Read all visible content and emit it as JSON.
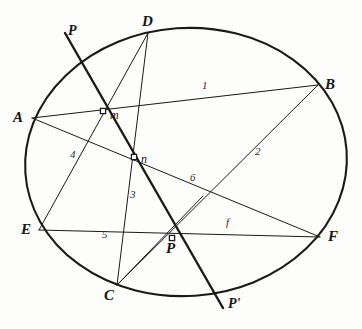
{
  "figure": {
    "canvas": {
      "width": 362,
      "height": 329
    },
    "background_color": "#fdfdfc",
    "ink_color": "#1a1a1a"
  },
  "conic": {
    "name": "ellipse",
    "center": {
      "x": 186,
      "y": 162
    },
    "radius_x": 161,
    "radius_y": 134,
    "rotation_deg": -4,
    "stroke_width": 2.1
  },
  "points": [
    {
      "id": "A",
      "label": "A",
      "x": 32,
      "y": 118,
      "label_x": 13,
      "label_y": 110,
      "marker": "none"
    },
    {
      "id": "B",
      "label": "B",
      "x": 318,
      "y": 85,
      "label_x": 325,
      "label_y": 77,
      "marker": "none"
    },
    {
      "id": "C",
      "label": "C",
      "x": 117,
      "y": 285,
      "label_x": 104,
      "label_y": 288,
      "marker": "none"
    },
    {
      "id": "D",
      "label": "D",
      "x": 148,
      "y": 33,
      "label_x": 142,
      "label_y": 14,
      "marker": "none"
    },
    {
      "id": "E",
      "label": "E",
      "x": 39,
      "y": 230,
      "label_x": 21,
      "label_y": 222,
      "marker": "none"
    },
    {
      "id": "F",
      "label": "F",
      "x": 320,
      "y": 237,
      "label_x": 328,
      "label_y": 229,
      "marker": "none"
    },
    {
      "id": "m",
      "label": "m",
      "x": 103,
      "y": 111,
      "label_x": 110,
      "label_y": 109,
      "marker": "square"
    },
    {
      "id": "n",
      "label": "n",
      "x": 134,
      "y": 157,
      "label_x": 141,
      "label_y": 153,
      "marker": "square"
    },
    {
      "id": "P",
      "label": "P",
      "x": 172,
      "y": 238,
      "label_x": 166,
      "label_y": 241,
      "marker": "square"
    }
  ],
  "poles": [
    {
      "id": "P-upper",
      "label": "P",
      "x": 65,
      "y": 33,
      "label_x": 68,
      "label_y": 24
    },
    {
      "id": "P-lower",
      "label": "P'",
      "x": 223,
      "y": 308,
      "label_x": 228,
      "label_y": 297
    }
  ],
  "chords": [
    {
      "id": "AB",
      "from": "A",
      "to": "B",
      "number": "1",
      "x1": 32,
      "y1": 118,
      "x2": 318,
      "y2": 85,
      "width": 1.1
    },
    {
      "id": "BP",
      "from": "B",
      "to": "P-through-E",
      "number": "2",
      "x1": 318,
      "y1": 85,
      "x2": 117,
      "y2": 285,
      "width": 1.0
    },
    {
      "id": "DC",
      "from": "D",
      "to": "C",
      "number": "3",
      "x1": 148,
      "y1": 33,
      "x2": 117,
      "y2": 285,
      "width": 1.0
    },
    {
      "id": "DE",
      "from": "D",
      "to": "E",
      "number": "4",
      "x1": 148,
      "y1": 33,
      "x2": 39,
      "y2": 230,
      "width": 1.0
    },
    {
      "id": "EF",
      "from": "E",
      "to": "F",
      "number": "5",
      "x1": 39,
      "y1": 230,
      "x2": 320,
      "y2": 237,
      "width": 1.1
    },
    {
      "id": "AF",
      "from": "A",
      "to": "F",
      "number": "6",
      "x1": 32,
      "y1": 118,
      "x2": 320,
      "y2": 237,
      "width": 1.0
    },
    {
      "id": "CP",
      "from": "C",
      "to": "P",
      "number": "",
      "x1": 117,
      "y1": 285,
      "x2": 203,
      "y2": 196,
      "width": 1.0
    }
  ],
  "pole_line": {
    "id": "polar-PP",
    "label_from": "P",
    "label_to": "P'",
    "x1": 65,
    "y1": 33,
    "x2": 223,
    "y2": 308,
    "width": 2.4
  },
  "line_numbers": [
    {
      "id": "num-1",
      "text": "1",
      "x": 202,
      "y": 80
    },
    {
      "id": "num-2",
      "text": "2",
      "x": 255,
      "y": 146
    },
    {
      "id": "num-3",
      "text": "3",
      "x": 130,
      "y": 189
    },
    {
      "id": "num-4",
      "text": "4",
      "x": 70,
      "y": 149
    },
    {
      "id": "num-5",
      "text": "5",
      "x": 102,
      "y": 229
    },
    {
      "id": "num-6",
      "text": "6",
      "x": 190,
      "y": 172
    },
    {
      "id": "num-f",
      "text": "f",
      "x": 226,
      "y": 217
    }
  ]
}
